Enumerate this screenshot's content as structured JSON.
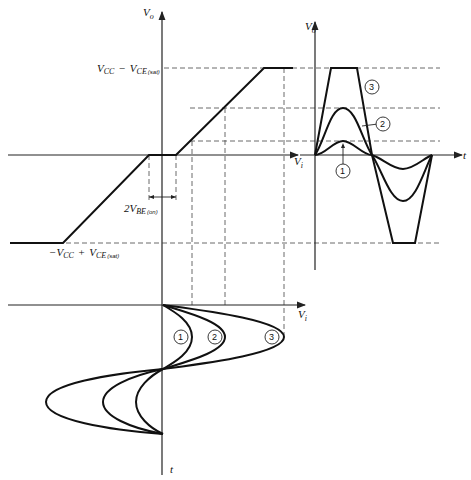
{
  "labels": {
    "vo_left": "V",
    "vo_left_sub": "o",
    "vo_right": "V",
    "vo_right_sub": "o",
    "vi_top": "V",
    "vi_top_sub": "i",
    "vi_bottom": "V",
    "vi_bottom_sub": "i",
    "t_right": "t",
    "t_bottom": "t",
    "pos_sat_main": "V",
    "pos_sat_cc": "CC",
    "pos_sat_minus": "−",
    "pos_sat_v2": "V",
    "pos_sat_ce": "CE",
    "pos_sat_sat": "(sat)",
    "neg_sat_main": "−V",
    "neg_sat_cc": "CC",
    "neg_sat_plus": "+",
    "neg_sat_v2": "V",
    "neg_sat_ce": "CE",
    "neg_sat_sat": "(sat)",
    "vbe_two": "2V",
    "vbe_be": "BE",
    "vbe_on": "(on)"
  },
  "curves": {
    "c1": "1",
    "c2": "2",
    "c3": "3"
  }
}
